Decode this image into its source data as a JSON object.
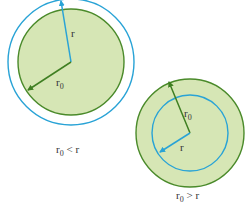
{
  "colors": {
    "fill": "#d6e6b5",
    "green_stroke": "#4a8a2a",
    "blue": "#29a3d6",
    "text": "#333333"
  },
  "figures": [
    {
      "id": "r0-less-than-r",
      "caption": {
        "base": "r",
        "sub": "0",
        "rest": " < r"
      },
      "labels": {
        "r": "r",
        "r0_base": "r",
        "r0_sub": "0"
      }
    },
    {
      "id": "r0-greater-than-r",
      "caption": {
        "base": "r",
        "sub": "0",
        "rest": " > r"
      },
      "labels": {
        "r": "r",
        "r0_base": "r",
        "r0_sub": "0"
      }
    }
  ]
}
